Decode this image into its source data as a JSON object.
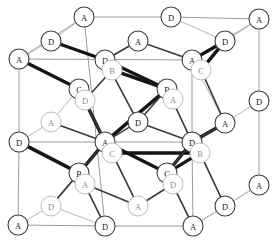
{
  "figure": {
    "background_color": "#ffffff",
    "frame_color": "#9a9a9a",
    "bond_color_bold": "#151515",
    "bond_color_mid": "#3a3a3a",
    "bond_color_thin": "#b9b9b9",
    "node_fill": "#ffffff",
    "node_stroke": "#3f3f3f",
    "node_stroke_faint": "#bdbdbd",
    "node_radius": 10
  },
  "labels": {
    "a": "A",
    "b": "B",
    "c": "C",
    "d": "D"
  },
  "nodes": [
    {
      "id": "n01",
      "label": "A",
      "x": 84,
      "y": 17,
      "faint": false
    },
    {
      "id": "n02",
      "label": "D",
      "x": 171,
      "y": 17,
      "faint": false
    },
    {
      "id": "n03",
      "label": "A",
      "x": 259,
      "y": 19,
      "faint": false
    },
    {
      "id": "n04",
      "label": "D",
      "x": 51,
      "y": 41,
      "faint": false
    },
    {
      "id": "n05",
      "label": "A",
      "x": 138,
      "y": 41,
      "faint": false
    },
    {
      "id": "n06",
      "label": "D",
      "x": 225,
      "y": 41,
      "faint": false
    },
    {
      "id": "n07",
      "label": "A",
      "x": 19,
      "y": 59,
      "faint": false
    },
    {
      "id": "n08",
      "label": "D",
      "x": 105,
      "y": 60,
      "faint": false
    },
    {
      "id": "n09",
      "label": "A",
      "x": 192,
      "y": 60,
      "faint": false
    },
    {
      "id": "n10",
      "label": "B",
      "x": 112,
      "y": 70,
      "faint": true
    },
    {
      "id": "n11",
      "label": "C",
      "x": 201,
      "y": 70,
      "faint": true
    },
    {
      "id": "n12",
      "label": "C",
      "x": 79,
      "y": 89,
      "faint": false
    },
    {
      "id": "n13",
      "label": "B",
      "x": 167,
      "y": 89,
      "faint": false
    },
    {
      "id": "n14",
      "label": "D",
      "x": 85,
      "y": 100,
      "faint": true
    },
    {
      "id": "n15",
      "label": "A",
      "x": 173,
      "y": 99,
      "faint": true
    },
    {
      "id": "n16",
      "label": "D",
      "x": 259,
      "y": 101,
      "faint": false
    },
    {
      "id": "n17",
      "label": "A",
      "x": 51,
      "y": 122,
      "faint": true
    },
    {
      "id": "n18",
      "label": "D",
      "x": 138,
      "y": 122,
      "faint": false
    },
    {
      "id": "n19",
      "label": "A",
      "x": 225,
      "y": 123,
      "faint": false
    },
    {
      "id": "n20",
      "label": "D",
      "x": 19,
      "y": 142,
      "faint": false
    },
    {
      "id": "n21",
      "label": "A",
      "x": 105,
      "y": 142,
      "faint": false
    },
    {
      "id": "n22",
      "label": "D",
      "x": 192,
      "y": 142,
      "faint": false
    },
    {
      "id": "n23",
      "label": "C",
      "x": 112,
      "y": 153,
      "faint": true
    },
    {
      "id": "n24",
      "label": "B",
      "x": 200,
      "y": 153,
      "faint": true
    },
    {
      "id": "n25",
      "label": "B",
      "x": 79,
      "y": 173,
      "faint": false
    },
    {
      "id": "n26",
      "label": "C",
      "x": 167,
      "y": 173,
      "faint": false
    },
    {
      "id": "n27",
      "label": "A",
      "x": 85,
      "y": 184,
      "faint": true
    },
    {
      "id": "n28",
      "label": "D",
      "x": 173,
      "y": 184,
      "faint": true
    },
    {
      "id": "n29",
      "label": "A",
      "x": 259,
      "y": 185,
      "faint": false
    },
    {
      "id": "n30",
      "label": "D",
      "x": 51,
      "y": 206,
      "faint": true
    },
    {
      "id": "n31",
      "label": "A",
      "x": 138,
      "y": 206,
      "faint": true
    },
    {
      "id": "n32",
      "label": "D",
      "x": 225,
      "y": 206,
      "faint": false
    },
    {
      "id": "n33",
      "label": "A",
      "x": 18,
      "y": 225,
      "faint": false
    },
    {
      "id": "n34",
      "label": "D",
      "x": 105,
      "y": 226,
      "faint": false
    },
    {
      "id": "n35",
      "label": "A",
      "x": 193,
      "y": 226,
      "faint": false
    }
  ],
  "frame_edges": [
    {
      "from": "n01",
      "to": "n02"
    },
    {
      "from": "n02",
      "to": "n03"
    },
    {
      "from": "n01",
      "to": "n07"
    },
    {
      "from": "n03",
      "to": "n16"
    },
    {
      "from": "n16",
      "to": "n29"
    },
    {
      "from": "n07",
      "to": "n20"
    },
    {
      "from": "n20",
      "to": "n33"
    },
    {
      "from": "n33",
      "to": "n34"
    },
    {
      "from": "n34",
      "to": "n35"
    },
    {
      "from": "n35",
      "to": "n29"
    },
    {
      "from": "n01",
      "to": "n34"
    },
    {
      "from": "n07",
      "to": "n09"
    },
    {
      "from": "n09",
      "to": "n03"
    },
    {
      "from": "n09",
      "to": "n22"
    },
    {
      "from": "n22",
      "to": "n35"
    },
    {
      "from": "n20",
      "to": "n22"
    }
  ],
  "thin_bonds": [
    {
      "from": "n07",
      "to": "n04"
    },
    {
      "from": "n04",
      "to": "n01"
    },
    {
      "from": "n02",
      "to": "n06"
    },
    {
      "from": "n06",
      "to": "n03"
    },
    {
      "from": "n03",
      "to": "n06"
    },
    {
      "from": "n16",
      "to": "n19"
    },
    {
      "from": "n19",
      "to": "n09"
    },
    {
      "from": "n29",
      "to": "n32"
    },
    {
      "from": "n32",
      "to": "n35"
    },
    {
      "from": "n33",
      "to": "n30"
    },
    {
      "from": "n30",
      "to": "n34"
    },
    {
      "from": "n20",
      "to": "n17"
    },
    {
      "from": "n17",
      "to": "n12"
    },
    {
      "from": "n12",
      "to": "n14"
    },
    {
      "from": "n13",
      "to": "n15"
    },
    {
      "from": "n21",
      "to": "n23"
    },
    {
      "from": "n26",
      "to": "n28"
    },
    {
      "from": "n25",
      "to": "n27"
    },
    {
      "from": "n08",
      "to": "n10"
    },
    {
      "from": "n09",
      "to": "n11"
    },
    {
      "from": "n22",
      "to": "n24"
    }
  ],
  "mid_bonds": [
    {
      "from": "n05",
      "to": "n08"
    },
    {
      "from": "n05",
      "to": "n09"
    },
    {
      "from": "n08",
      "to": "n18"
    },
    {
      "from": "n18",
      "to": "n13"
    },
    {
      "from": "n18",
      "to": "n21"
    },
    {
      "from": "n18",
      "to": "n22"
    },
    {
      "from": "n12",
      "to": "n21"
    },
    {
      "from": "n21",
      "to": "n25"
    },
    {
      "from": "n13",
      "to": "n22"
    },
    {
      "from": "n22",
      "to": "n26"
    },
    {
      "from": "n25",
      "to": "n34"
    },
    {
      "from": "n26",
      "to": "n35"
    },
    {
      "from": "n31",
      "to": "n27"
    },
    {
      "from": "n31",
      "to": "n28"
    },
    {
      "from": "n17",
      "to": "n21"
    },
    {
      "from": "n19",
      "to": "n22"
    },
    {
      "from": "n30",
      "to": "n25"
    },
    {
      "from": "n11",
      "to": "n19"
    },
    {
      "from": "n10",
      "to": "n14"
    },
    {
      "from": "n23",
      "to": "n31"
    },
    {
      "from": "n24",
      "to": "n32"
    }
  ],
  "bold_bonds": [
    {
      "from": "n04",
      "to": "n08"
    },
    {
      "from": "n08",
      "to": "n13"
    },
    {
      "from": "n10",
      "to": "n13"
    },
    {
      "from": "n09",
      "to": "n06"
    },
    {
      "from": "n11",
      "to": "n06"
    },
    {
      "from": "n07",
      "to": "n12"
    },
    {
      "from": "n12",
      "to": "n21"
    },
    {
      "from": "n21",
      "to": "n13"
    },
    {
      "from": "n23",
      "to": "n24"
    },
    {
      "from": "n21",
      "to": "n26"
    },
    {
      "from": "n25",
      "to": "n21"
    },
    {
      "from": "n20",
      "to": "n25"
    },
    {
      "from": "n22",
      "to": "n26"
    },
    {
      "from": "n19",
      "to": "n22"
    },
    {
      "from": "n13",
      "to": "n15"
    },
    {
      "from": "n08",
      "to": "n10"
    },
    {
      "from": "n24",
      "to": "n26"
    },
    {
      "from": "n12",
      "to": "n14"
    }
  ]
}
